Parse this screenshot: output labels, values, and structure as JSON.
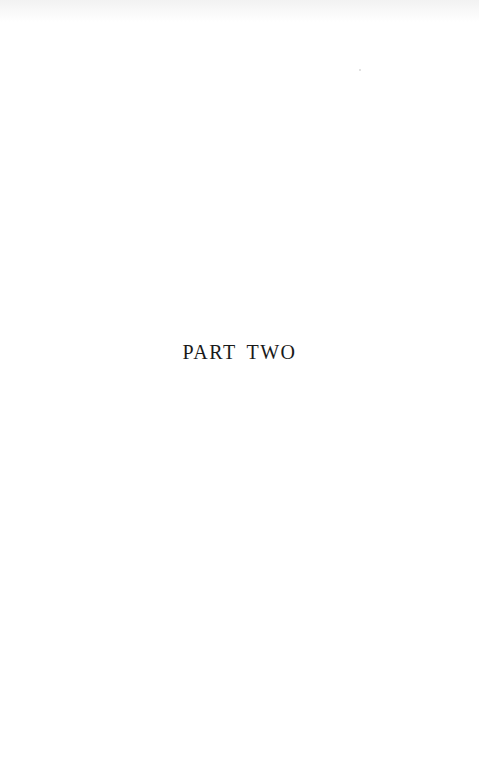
{
  "page": {
    "part_title": "PART TWO"
  }
}
